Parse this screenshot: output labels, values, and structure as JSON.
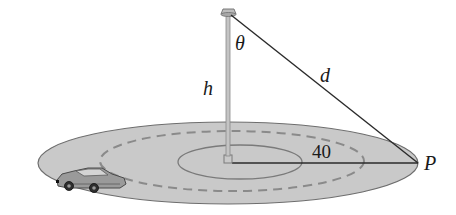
{
  "diagram": {
    "labels": {
      "angle": "θ",
      "height": "h",
      "distance": "d",
      "radius": "40",
      "point": "P"
    },
    "colors": {
      "ground": "#c9c9c9",
      "ground_edge": "#6e6e6e",
      "line": "#2a2a2a",
      "pole": "#b5b5b5",
      "dashed": "#8a8a8a"
    },
    "objects": [
      "light-pole",
      "lamp",
      "car",
      "ground-disc",
      "inner-circle",
      "dashed-track"
    ]
  }
}
